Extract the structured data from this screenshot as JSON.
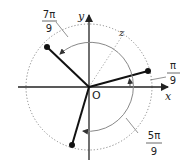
{
  "diagram": {
    "title": "",
    "origin_label": "O",
    "x_axis_label": "x",
    "y_axis_label": "y",
    "terminal_line_label": "z",
    "angles": [
      {
        "name": "pi-over-9",
        "numerator": "π",
        "denominator": "9",
        "value": "π/9",
        "direction": "counterclockwise"
      },
      {
        "name": "7pi-over-9",
        "numerator": "7π",
        "denominator": "9",
        "value": "7π/9",
        "direction": "counterclockwise"
      },
      {
        "name": "5pi-over-9",
        "numerator": "5π",
        "denominator": "9",
        "value": "5π/9",
        "direction": "clockwise"
      }
    ],
    "colors": {
      "axis": "#222222",
      "segment": "#111111",
      "circle": "#777777",
      "arc": "#888888"
    }
  }
}
